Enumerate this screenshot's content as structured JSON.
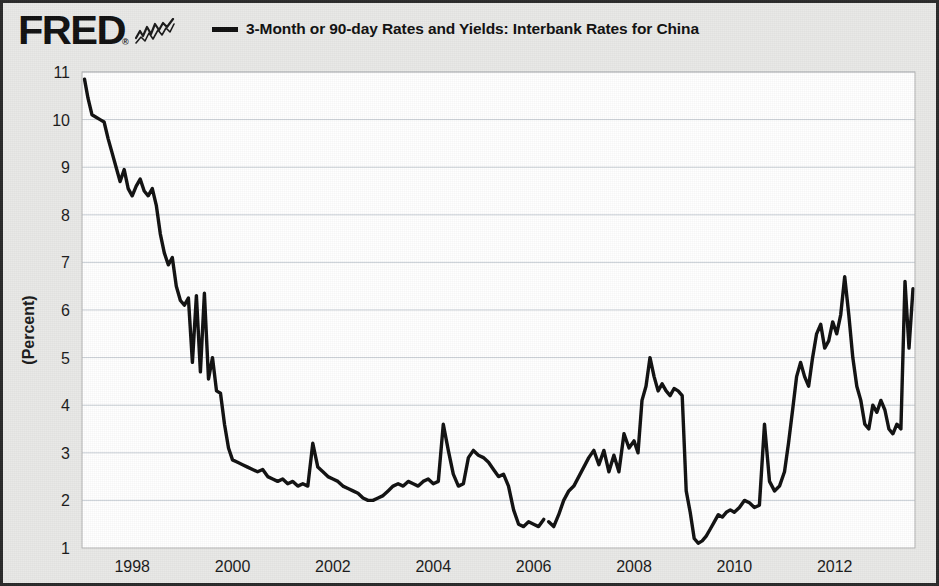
{
  "header": {
    "logo_text": "FRED",
    "logo_registered": "®",
    "logo_icon": "sparkline-icon",
    "legend": [
      {
        "label": "3-Month or 90-day Rates and Yields: Interbank Rates for China",
        "color": "#111111"
      }
    ]
  },
  "chart_data": {
    "type": "line",
    "title": "",
    "subtitle": "",
    "xlabel": "",
    "ylabel": "(Percent)",
    "ylim": [
      1,
      11
    ],
    "xlim": [
      1997.0,
      2013.6
    ],
    "grid": true,
    "legend_position": "top",
    "y_ticks": [
      1,
      2,
      3,
      4,
      5,
      6,
      7,
      8,
      9,
      10,
      11
    ],
    "x_ticks": [
      1998,
      2000,
      2002,
      2004,
      2006,
      2008,
      2010,
      2012
    ],
    "series": [
      {
        "name": "3-Month or 90-day Rates and Yields: Interbank Rates for China",
        "color": "#111111",
        "units": "Percent",
        "x": [
          1997.05,
          1997.12,
          1997.2,
          1997.28,
          1997.36,
          1997.44,
          1997.52,
          1997.6,
          1997.68,
          1997.76,
          1997.84,
          1997.92,
          1998.0,
          1998.08,
          1998.16,
          1998.24,
          1998.32,
          1998.4,
          1998.48,
          1998.56,
          1998.64,
          1998.72,
          1998.8,
          1998.88,
          1998.96,
          1999.04,
          1999.12,
          1999.2,
          1999.28,
          1999.36,
          1999.44,
          1999.52,
          1999.6,
          1999.68,
          1999.76,
          1999.84,
          1999.92,
          2000.0,
          2000.1,
          2000.2,
          2000.3,
          2000.4,
          2000.5,
          2000.6,
          2000.7,
          2000.8,
          2000.9,
          2001.0,
          2001.1,
          2001.2,
          2001.3,
          2001.4,
          2001.5,
          2001.6,
          2001.7,
          2001.8,
          2001.9,
          2002.0,
          2002.1,
          2002.2,
          2002.3,
          2002.4,
          2002.5,
          2002.6,
          2002.7,
          2002.8,
          2002.9,
          2003.0,
          2003.1,
          2003.2,
          2003.3,
          2003.4,
          2003.5,
          2003.6,
          2003.7,
          2003.8,
          2003.9,
          2004.0,
          2004.1,
          2004.2,
          2004.3,
          2004.4,
          2004.5,
          2004.6,
          2004.7,
          2004.8,
          2004.9,
          2005.0,
          2005.1,
          2005.2,
          2005.3,
          2005.4,
          2005.5,
          2005.6,
          2005.7,
          2005.8,
          2005.9,
          2006.0,
          2006.1,
          2006.2,
          2006.3,
          2006.4,
          2006.5,
          2006.6,
          2006.7,
          2006.8,
          2006.9,
          2007.0,
          2007.1,
          2007.2,
          2007.3,
          2007.4,
          2007.5,
          2007.6,
          2007.7,
          2007.8,
          2007.9,
          2008.0,
          2008.08,
          2008.16,
          2008.24,
          2008.32,
          2008.4,
          2008.48,
          2008.56,
          2008.64,
          2008.72,
          2008.8,
          2008.88,
          2008.96,
          2009.04,
          2009.12,
          2009.2,
          2009.28,
          2009.36,
          2009.44,
          2009.52,
          2009.6,
          2009.68,
          2009.76,
          2009.84,
          2009.92,
          2010.0,
          2010.1,
          2010.2,
          2010.3,
          2010.4,
          2010.5,
          2010.6,
          2010.7,
          2010.8,
          2010.9,
          2011.0,
          2011.08,
          2011.16,
          2011.24,
          2011.32,
          2011.4,
          2011.48,
          2011.56,
          2011.64,
          2011.72,
          2011.8,
          2011.88,
          2011.96,
          2012.04,
          2012.12,
          2012.2,
          2012.28,
          2012.36,
          2012.44,
          2012.52,
          2012.6,
          2012.68,
          2012.76,
          2012.84,
          2012.92,
          2013.0,
          2013.08,
          2013.16,
          2013.24,
          2013.32,
          2013.4,
          2013.48,
          2013.56
        ],
        "y": [
          10.85,
          10.45,
          10.1,
          10.05,
          10.0,
          9.95,
          9.6,
          9.3,
          9.0,
          8.7,
          8.95,
          8.55,
          8.4,
          8.6,
          8.75,
          8.5,
          8.4,
          8.55,
          8.2,
          7.6,
          7.2,
          6.95,
          7.1,
          6.5,
          6.2,
          6.1,
          6.25,
          4.9,
          6.3,
          4.7,
          6.35,
          4.55,
          5.0,
          4.3,
          4.25,
          3.6,
          3.1,
          2.85,
          2.8,
          2.75,
          2.7,
          2.65,
          2.6,
          2.65,
          2.5,
          2.45,
          2.4,
          2.45,
          2.35,
          2.4,
          2.3,
          2.35,
          2.3,
          3.2,
          2.7,
          2.6,
          2.5,
          2.45,
          2.4,
          2.3,
          2.25,
          2.2,
          2.15,
          2.05,
          2.0,
          2.0,
          2.05,
          2.1,
          2.2,
          2.3,
          2.35,
          2.3,
          2.4,
          2.35,
          2.3,
          2.4,
          2.45,
          2.35,
          2.4,
          3.6,
          3.05,
          2.55,
          2.3,
          2.35,
          2.9,
          3.05,
          2.95,
          2.9,
          2.8,
          2.65,
          2.5,
          2.55,
          2.3,
          1.8,
          1.5,
          1.45,
          1.55,
          1.5,
          1.45,
          1.6,
          1.55,
          1.45,
          1.7,
          2.0,
          2.2,
          2.3,
          2.5,
          2.7,
          2.9,
          3.05,
          2.75,
          3.05,
          2.6,
          2.95,
          2.6,
          3.4,
          3.1,
          3.25,
          3.0,
          4.1,
          4.4,
          5.0,
          4.6,
          4.3,
          4.45,
          4.3,
          4.2,
          4.35,
          4.3,
          4.2,
          2.2,
          1.75,
          1.2,
          1.1,
          1.15,
          1.25,
          1.4,
          1.55,
          1.7,
          1.65,
          1.75,
          1.8,
          1.75,
          1.85,
          2.0,
          1.95,
          1.85,
          1.9,
          3.6,
          2.4,
          2.2,
          2.3,
          2.6,
          3.2,
          3.9,
          4.6,
          4.9,
          4.6,
          4.4,
          5.0,
          5.5,
          5.7,
          5.2,
          5.35,
          5.75,
          5.5,
          5.9,
          6.7,
          5.9,
          5.0,
          4.4,
          4.1,
          3.6,
          3.5,
          4.0,
          3.85,
          4.1,
          3.9,
          3.5,
          3.4,
          3.6,
          3.5,
          6.6,
          5.2,
          6.45
        ],
        "breaks": [
          {
            "after_index": 99
          }
        ],
        "max_value": 10.85,
        "min_value": 1.1
      }
    ]
  },
  "axes": {
    "y_tick_labels": [
      "1",
      "2",
      "3",
      "4",
      "5",
      "6",
      "7",
      "8",
      "9",
      "10",
      "11"
    ],
    "x_tick_labels": [
      "1998",
      "2000",
      "2002",
      "2004",
      "2006",
      "2008",
      "2010",
      "2012"
    ],
    "y_axis_title": "(Percent)"
  },
  "colors": {
    "series": "#111111",
    "plot_background": "#ffffff",
    "page_background": "#e9e9e7",
    "grid": "#c9cfd6",
    "border": "#2b2b2b",
    "text": "#1c1c1c"
  }
}
